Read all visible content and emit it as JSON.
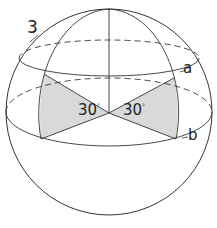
{
  "diagram": {
    "figure_number": "3",
    "angle_left": "30",
    "angle_right": "30",
    "degree_symbol": "°",
    "latitude_upper_label": "a",
    "latitude_lower_label": "b",
    "colors": {
      "stroke": "#333333",
      "shade": "#d9d9d9",
      "background": "#ffffff"
    }
  }
}
